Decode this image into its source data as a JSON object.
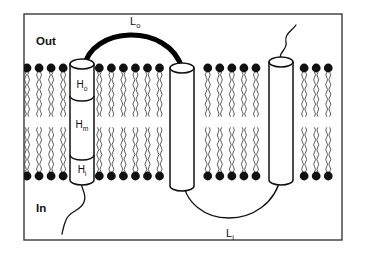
{
  "figure": {
    "background_color": "#ffffff",
    "border_color": "#3a3a3a"
  },
  "compartment_labels": {
    "outside": "Out",
    "inside": "In"
  },
  "membrane": {
    "head_color": "#111111",
    "tail_color": "#3f3f3f",
    "outer_leaflet_y": 68,
    "inner_leaflet_y": 176,
    "head_count_outer": 26,
    "head_count_inner": 26
  },
  "helices": [
    {
      "id": "helix-1",
      "segments": [
        {
          "label": "H",
          "subscript": "o"
        },
        {
          "label": "H",
          "subscript": "m"
        },
        {
          "label": "H",
          "subscript": "i"
        }
      ],
      "fill": "#ffffff",
      "stroke": "#101010"
    },
    {
      "id": "helix-2",
      "segments": [],
      "fill": "#ffffff",
      "stroke": "#101010"
    },
    {
      "id": "helix-3",
      "segments": [],
      "fill": "#ffffff",
      "stroke": "#101010"
    }
  ],
  "loops": [
    {
      "id": "loop-outer",
      "label": "L",
      "subscript": "o",
      "style": "thick",
      "color": "#000000",
      "side": "outside"
    },
    {
      "id": "loop-inner",
      "label": "L",
      "subscript": "i",
      "style": "thin",
      "color": "#111111",
      "side": "inside"
    }
  ],
  "termini": [
    {
      "id": "terminus-c",
      "side": "inside",
      "attached_to": "helix-1"
    },
    {
      "id": "terminus-n",
      "side": "outside",
      "attached_to": "helix-3"
    }
  ]
}
